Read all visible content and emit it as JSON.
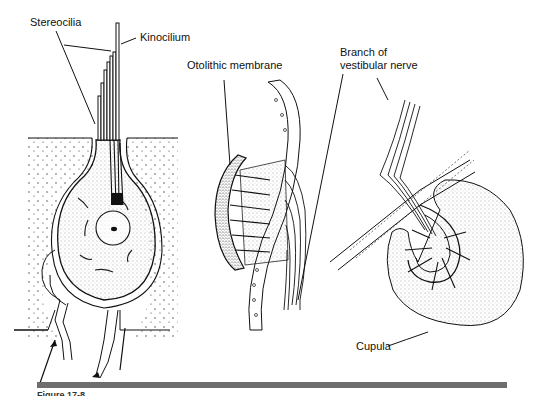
{
  "figure": {
    "labels": {
      "stereocilia": "Stereocilia",
      "kinocilium": "Kinocilium",
      "otolithic_membrane": "Otolithic membrane",
      "branch_line1": "Branch of",
      "branch_line2": "vestibular nerve",
      "cupula": "Cupula"
    },
    "caption_partial": "Figure 17-8",
    "colors": {
      "ink": "#111111",
      "rule": "#6e6e6e",
      "stipple": "#555555",
      "background": "#ffffff"
    }
  }
}
